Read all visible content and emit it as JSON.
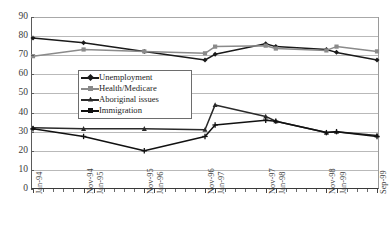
{
  "title_remnant": "",
  "chart_data": {
    "type": "line",
    "title": "",
    "subtitle": "",
    "xlabel": "",
    "ylabel": "",
    "ylim": [
      0,
      90
    ],
    "yticks": [
      0,
      10,
      20,
      30,
      40,
      50,
      60,
      70,
      80,
      90
    ],
    "grid": true,
    "legend_position": "inside-upper-left",
    "x": [
      "Jan-94",
      "Mar-94",
      "May-94",
      "Jul-94",
      "Sep-94",
      "Nov-94",
      "Jan-95",
      "Mar-95",
      "May-95",
      "Jul-95",
      "Sep-95",
      "Nov-95",
      "Jan-96",
      "Mar-96",
      "May-96",
      "Jul-96",
      "Sep-96",
      "Nov-96",
      "Jan-97",
      "Mar-97",
      "May-97",
      "Jul-97",
      "Sep-97",
      "Nov-97",
      "Jan-98",
      "Mar-98",
      "May-98",
      "Jul-98",
      "Sep-98",
      "Nov-98",
      "Jan-99",
      "Mar-99",
      "May-99",
      "Jul-99",
      "Sep-99"
    ],
    "tick_labels": [
      "Jan-94",
      "Nov-94",
      "Jan-95",
      "Nov-95",
      "Jan-96",
      "Nov-96",
      "Jan-97",
      "Nov-97",
      "Jan-98",
      "Nov-98",
      "Jan-99",
      "Sep-99"
    ],
    "series": [
      {
        "name": "Unemployment",
        "color": "#1a1a1a",
        "marker": "diamond",
        "x": [
          "Jan-94",
          "Nov-94",
          "Nov-95",
          "Nov-96",
          "Jan-97",
          "Nov-97",
          "Jan-98",
          "Nov-98",
          "Jan-99",
          "Sep-99"
        ],
        "values": [
          79,
          76.5,
          72,
          67.5,
          70.5,
          76,
          74.5,
          73,
          71.5,
          67.5
        ]
      },
      {
        "name": "Health/Medicare",
        "color": "#8a8a8a",
        "marker": "square",
        "x": [
          "Jan-94",
          "Nov-94",
          "Nov-95",
          "Nov-96",
          "Jan-97",
          "Nov-97",
          "Jan-98",
          "Nov-98",
          "Jan-99",
          "Sep-99"
        ],
        "values": [
          69.5,
          73,
          72,
          71,
          74.5,
          75,
          73.5,
          72.5,
          74.5,
          72
        ]
      },
      {
        "name": "Aboriginal issues",
        "color": "#2a2a2a",
        "marker": "triangle",
        "x": [
          "Jan-94",
          "Nov-94",
          "Nov-95",
          "Nov-96",
          "Jan-97",
          "Nov-97",
          "Jan-98",
          "Nov-98",
          "Jan-99",
          "Sep-99"
        ],
        "values": [
          32,
          31.5,
          31.5,
          31,
          44,
          38,
          35.5,
          29.5,
          30,
          28
        ]
      },
      {
        "name": "Immigration",
        "color": "#111111",
        "marker": "cross",
        "x": [
          "Jan-94",
          "Nov-94",
          "Nov-95",
          "Nov-96",
          "Jan-97",
          "Nov-97",
          "Jan-98",
          "Nov-98",
          "Jan-99",
          "Sep-99"
        ],
        "values": [
          31.5,
          27.5,
          20,
          27.5,
          33.5,
          36,
          35.5,
          29.5,
          30,
          27.5
        ]
      }
    ]
  },
  "legend": {
    "items": [
      {
        "label": "Unemployment"
      },
      {
        "label": "Health/Medicare"
      },
      {
        "label": "Aboriginal issues"
      },
      {
        "label": "Immigration"
      }
    ]
  }
}
